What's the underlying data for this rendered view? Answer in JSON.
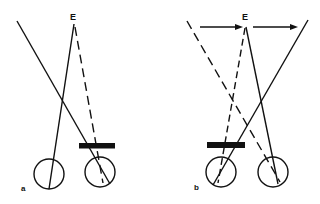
{
  "figure": {
    "panels": [
      {
        "id": "a",
        "label": "a",
        "point_label": "E",
        "components": [
          "left-eye",
          "right-eye",
          "occluder-bar",
          "line-of-sight-solid",
          "crossing-line",
          "dashed-line"
        ]
      },
      {
        "id": "b",
        "label": "b",
        "point_label": "E",
        "components": [
          "left-eye",
          "right-eye",
          "occluder-bar",
          "line-of-sight-solid",
          "crossing-line",
          "dashed-lines",
          "motion-arrows"
        ]
      }
    ],
    "colors": {
      "ink": "#111111",
      "background": "#ffffff"
    }
  }
}
